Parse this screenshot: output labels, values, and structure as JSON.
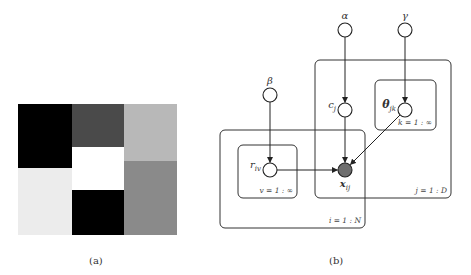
{
  "panel_a": {
    "caption": "(a)",
    "cells": [
      {
        "x": 18,
        "y": 104,
        "w": 54,
        "h": 64,
        "color": "#000000"
      },
      {
        "x": 18,
        "y": 168,
        "w": 54,
        "h": 67,
        "color": "#ececec"
      },
      {
        "x": 72,
        "y": 104,
        "w": 52,
        "h": 43,
        "color": "#4a4a4a"
      },
      {
        "x": 72,
        "y": 147,
        "w": 52,
        "h": 43,
        "color": "#ffffff"
      },
      {
        "x": 72,
        "y": 190,
        "w": 52,
        "h": 45,
        "color": "#000000"
      },
      {
        "x": 124,
        "y": 104,
        "w": 53,
        "h": 57,
        "color": "#b8b8b8"
      },
      {
        "x": 124,
        "y": 161,
        "w": 53,
        "h": 74,
        "color": "#8a8a8a"
      }
    ]
  },
  "panel_b": {
    "caption": "(b)",
    "nodes": [
      {
        "id": "alpha",
        "label": "α",
        "cx": 345,
        "cy": 30,
        "observed": false
      },
      {
        "id": "gamma",
        "label": "γ",
        "cx": 405,
        "cy": 30,
        "observed": false
      },
      {
        "id": "beta",
        "label": "β",
        "cx": 270,
        "cy": 95,
        "observed": false
      },
      {
        "id": "c_j",
        "label": "c",
        "sub": "j",
        "cx": 345,
        "cy": 110,
        "observed": false
      },
      {
        "id": "theta_jk",
        "label": "θ",
        "sub": "jk",
        "cx": 405,
        "cy": 110,
        "observed": false
      },
      {
        "id": "r_iv",
        "label": "r",
        "sub": "iv",
        "cx": 270,
        "cy": 170,
        "observed": false
      },
      {
        "id": "x_ij",
        "label": "x",
        "sub": "ij",
        "cx": 345,
        "cy": 170,
        "observed": true
      }
    ],
    "plates": [
      {
        "id": "plate-i",
        "label": "i = 1 : N",
        "x": 220,
        "y": 130,
        "w": 145,
        "h": 98
      },
      {
        "id": "plate-v",
        "label": "v = 1 : ∞",
        "x": 238,
        "y": 145,
        "w": 59,
        "h": 53
      },
      {
        "id": "plate-j",
        "label": "j = 1 : D",
        "x": 315,
        "y": 60,
        "w": 136,
        "h": 138
      },
      {
        "id": "plate-k",
        "label": "k = 1 : ∞",
        "x": 375,
        "y": 80,
        "w": 61,
        "h": 50
      }
    ],
    "edges": [
      {
        "from": "alpha",
        "to": "c_j"
      },
      {
        "from": "gamma",
        "to": "theta_jk"
      },
      {
        "from": "beta",
        "to": "r_iv"
      },
      {
        "from": "c_j",
        "to": "x_ij"
      },
      {
        "from": "theta_jk",
        "to": "x_ij"
      },
      {
        "from": "r_iv",
        "to": "x_ij"
      }
    ],
    "colors": {
      "observed_fill": "#6e6e6e",
      "stroke": "#222222"
    }
  }
}
